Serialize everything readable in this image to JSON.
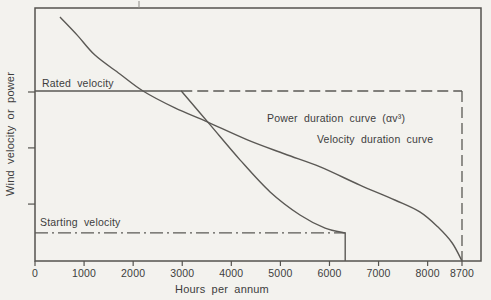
{
  "figure": {
    "background": "#f3f2ee",
    "ink": "#55534f",
    "labels": {
      "y_axis": "Wind velocity or power",
      "x_axis": "Hours per annum",
      "rated": "Rated velocity",
      "starting": "Starting velocity",
      "power_curve": "Power duration curve (αv³)",
      "velocity_curve": "Velocity duration curve"
    }
  },
  "chart_data": {
    "type": "line",
    "title": "",
    "xlabel": "Hours per annum",
    "ylabel": "Wind velocity or power",
    "xlim": [
      0,
      9100
    ],
    "ylim_relative": [
      0,
      1
    ],
    "grid": false,
    "x_ticks": [
      {
        "v": 0,
        "label": "0"
      },
      {
        "v": 1000,
        "label": "1000"
      },
      {
        "v": 2000,
        "label": "2000"
      },
      {
        "v": 3000,
        "label": "3000"
      },
      {
        "v": 4000,
        "label": "4000"
      },
      {
        "v": 5000,
        "label": "5000"
      },
      {
        "v": 6000,
        "label": "6000"
      },
      {
        "v": 7000,
        "label": "7000"
      },
      {
        "v": 8000,
        "label": "8000"
      },
      {
        "v": 8700,
        "label": "8700"
      }
    ],
    "y_ticks_relative": [
      0.668,
      0.447,
      0.225
    ],
    "series": [
      {
        "name": "Velocity duration curve",
        "points": [
          [
            510,
            0.964
          ],
          [
            860,
            0.893
          ],
          [
            1220,
            0.814
          ],
          [
            1730,
            0.739
          ],
          [
            2200,
            0.672
          ],
          [
            2850,
            0.605
          ],
          [
            3520,
            0.549
          ],
          [
            4340,
            0.478
          ],
          [
            5090,
            0.423
          ],
          [
            5810,
            0.372
          ],
          [
            6620,
            0.3
          ],
          [
            7330,
            0.241
          ],
          [
            7840,
            0.194
          ],
          [
            8210,
            0.134
          ],
          [
            8500,
            0.071
          ],
          [
            8700,
            0.0
          ]
        ]
      },
      {
        "name": "Power duration curve (αv³)",
        "flat_from_hours": 0,
        "flat_level": 0.672,
        "points": [
          [
            2980,
            0.672
          ],
          [
            3570,
            0.538
          ],
          [
            4180,
            0.399
          ],
          [
            4790,
            0.273
          ],
          [
            5400,
            0.182
          ],
          [
            5910,
            0.13
          ],
          [
            6320,
            0.111
          ]
        ],
        "drops_to_zero_at_hours": 6320
      }
    ],
    "reference_lines": [
      {
        "name": "Rated velocity",
        "level": 0.672,
        "solid_to_hours": 2980,
        "dashed_to_hours": 8700
      },
      {
        "name": "Starting velocity",
        "level": 0.111,
        "style": "dash-dot",
        "from_hours": 0,
        "to_hours": 6320
      },
      {
        "name": "Hours in year",
        "hours": 8700,
        "style": "dashed-vertical",
        "from_level": 0.672,
        "to_level": 0
      }
    ]
  }
}
